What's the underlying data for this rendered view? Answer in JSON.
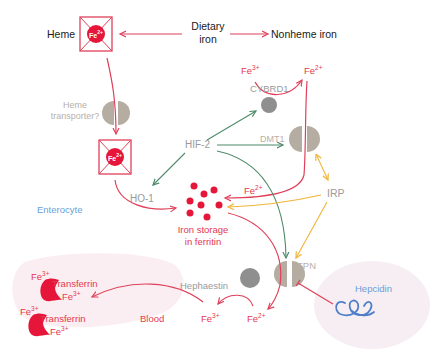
{
  "colors": {
    "iron_red": "#e5163a",
    "arrow_red": "#e0405a",
    "green": "#4f8a6a",
    "yellow": "#f0b53a",
    "transporter": "#b5aca2",
    "protein_grey": "#8f8f8f",
    "hepcidin_blue": "#4f7fc8",
    "blood_bg": "#fbeef2",
    "hepcidin_bg": "#f7eef3"
  },
  "labels": {
    "heme": "Heme",
    "dietary_iron_1": "Dietary",
    "dietary_iron_2": "iron",
    "nonheme_iron": "Nonheme iron",
    "fe3_top": "Fe",
    "fe3_top_sup": "3+",
    "fe2_top": "Fe",
    "fe2_top_sup": "2+",
    "cybrd1": "CYBRD1",
    "heme_transporter_1": "Heme",
    "heme_transporter_2": "transporter?",
    "hif2": "HIF-2",
    "dmt1": "DMT1",
    "ho1": "HO-1",
    "enterocyte": "Enterocyte",
    "fe2_mid": "Fe",
    "fe2_mid_sup": "2+",
    "irp": "IRP",
    "iron_storage_1": "Iron storage",
    "iron_storage_2": "in ferritin",
    "fpn": "FPN",
    "hephaestin": "Hephaestin",
    "fe3_bottom": "Fe",
    "fe3_bottom_sup": "3+",
    "fe2_bottom": "Fe",
    "fe2_bottom_sup": "2+",
    "hepcidin": "Hepcidin",
    "blood": "Blood",
    "transferrin_1": "Transferrin",
    "transferrin_2": "Transferrin",
    "tf1_fe_a": "Fe",
    "tf1_fe_a_sup": "3+",
    "tf1_fe_b": "Fe",
    "tf1_fe_b_sup": "3+",
    "tf2_fe_a": "Fe",
    "tf2_fe_a_sup": "3+",
    "tf2_fe_b": "Fe",
    "tf2_fe_b_sup": "3+",
    "heme_fe_top": "Fe",
    "heme_fe_top_sup": "2+",
    "heme_fe_inner": "Fe",
    "heme_fe_inner_sup": "2+"
  }
}
